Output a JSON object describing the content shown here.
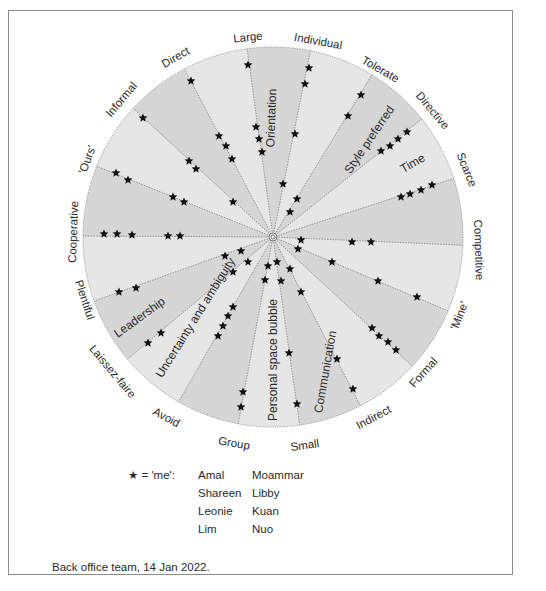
{
  "diagram": {
    "center": [
      273,
      237
    ],
    "radius": 190,
    "colors": {
      "sector_dark": "#d6d6d6",
      "sector_light": "#e6e6e6",
      "spoke": "#6e6e6e",
      "star": "#111111",
      "text": "#2a2a2a",
      "frame": "#8a8a8a"
    },
    "poles": [
      {
        "label": "Large",
        "end": [
          247,
          48
        ],
        "text_pos": [
          248,
          38
        ],
        "rotate": -6
      },
      {
        "label": "Individual",
        "end": [
          310,
          52
        ],
        "text_pos": [
          318,
          42
        ],
        "rotate": 10
      },
      {
        "label": "Tolerate",
        "end": [
          370,
          78
        ],
        "text_pos": [
          380,
          70
        ],
        "rotate": 30
      },
      {
        "label": "Directive",
        "end": [
          418,
          122
        ],
        "text_pos": [
          432,
          111
        ],
        "rotate": 50
      },
      {
        "label": "Scarce",
        "end": [
          449,
          180
        ],
        "text_pos": [
          466,
          170
        ],
        "rotate": 68
      },
      {
        "label": "Competitive",
        "end": [
          458,
          245
        ],
        "text_pos": [
          478,
          250
        ],
        "rotate": 88
      },
      {
        "label": "'Mine'",
        "end": [
          446,
          310
        ],
        "text_pos": [
          460,
          316
        ],
        "rotate": -68
      },
      {
        "label": "Formal",
        "end": [
          411,
          365
        ],
        "text_pos": [
          424,
          373
        ],
        "rotate": -48
      },
      {
        "label": "Indirect",
        "end": [
          360,
          405
        ],
        "text_pos": [
          374,
          418
        ],
        "rotate": -28
      },
      {
        "label": "Small",
        "end": [
          300,
          427
        ],
        "text_pos": [
          305,
          446
        ],
        "rotate": -8
      },
      {
        "label": "Group",
        "end": [
          238,
          425
        ],
        "text_pos": [
          234,
          444
        ],
        "rotate": 10
      },
      {
        "label": "Avoid",
        "end": [
          178,
          403
        ],
        "text_pos": [
          166,
          418
        ],
        "rotate": 28
      },
      {
        "label": "Laissez-faire",
        "end": [
          130,
          357
        ],
        "text_pos": [
          112,
          372
        ],
        "rotate": 50
      },
      {
        "label": "Plentiful",
        "end": [
          97,
          300
        ],
        "text_pos": [
          84,
          300
        ],
        "rotate": 72
      },
      {
        "label": "Cooperative",
        "end": [
          87,
          236
        ],
        "text_pos": [
          74,
          232
        ],
        "rotate": -88
      },
      {
        "label": "'Ours'",
        "end": [
          101,
          168
        ],
        "text_pos": [
          88,
          160
        ],
        "rotate": -70
      },
      {
        "label": "Informal",
        "end": [
          136,
          111
        ],
        "text_pos": [
          122,
          100
        ],
        "rotate": -50
      },
      {
        "label": "Direct",
        "end": [
          185,
          70
        ],
        "text_pos": [
          176,
          58
        ],
        "rotate": -30
      }
    ],
    "sectors": [
      {
        "label": "Orientation",
        "pos": [
          272,
          118
        ],
        "rotate": -88
      },
      {
        "label": "Style preferred",
        "pos": [
          370,
          140
        ],
        "rotate": -56
      },
      {
        "label": "Time",
        "pos": [
          413,
          164
        ],
        "rotate": -30
      },
      {
        "label": "Leadership",
        "pos": [
          140,
          318
        ],
        "rotate": -36
      },
      {
        "label": "Uncertainty and ambiguity",
        "pos": [
          196,
          318
        ],
        "rotate": -58
      },
      {
        "label": "Personal space bubble",
        "pos": [
          274,
          360
        ],
        "rotate": -90
      },
      {
        "label": "Communication",
        "pos": [
          326,
          372
        ],
        "rotate": -80
      }
    ],
    "stars": [
      {
        "spoke": "Large",
        "points": [
          [
            248,
            65
          ],
          [
            256,
            127
          ],
          [
            259,
            139
          ],
          [
            262,
            152
          ]
        ]
      },
      {
        "spoke": "Individual",
        "points": [
          [
            309,
            68
          ],
          [
            305,
            84
          ],
          [
            295,
            134
          ],
          [
            283,
            184
          ]
        ]
      },
      {
        "spoke": "Tolerate",
        "points": [
          [
            361,
            95
          ],
          [
            348,
            116
          ],
          [
            297,
            199
          ],
          [
            290,
            212
          ]
        ]
      },
      {
        "spoke": "Directive",
        "points": [
          [
            407,
            132
          ],
          [
            398,
            139
          ],
          [
            390,
            146
          ],
          [
            381,
            151
          ]
        ]
      },
      {
        "spoke": "Scarce",
        "points": [
          [
            432,
            185
          ],
          [
            421,
            190
          ],
          [
            410,
            194
          ],
          [
            401,
            197
          ]
        ]
      },
      {
        "spoke": "Competitive",
        "points": [
          [
            301,
            240
          ],
          [
            352,
            242
          ],
          [
            371,
            242
          ]
        ]
      },
      {
        "spoke": "'Mine'",
        "points": [
          [
            298,
            249
          ],
          [
            332,
            262
          ],
          [
            378,
            281
          ],
          [
            417,
            297
          ]
        ]
      },
      {
        "spoke": "Formal",
        "points": [
          [
            372,
            328
          ],
          [
            379,
            336
          ],
          [
            388,
            342
          ],
          [
            396,
            350
          ]
        ]
      },
      {
        "spoke": "Indirect",
        "points": [
          [
            290,
            269
          ],
          [
            301,
            292
          ],
          [
            337,
            359
          ],
          [
            353,
            389
          ]
        ]
      },
      {
        "spoke": "Small",
        "points": [
          [
            277,
            262
          ],
          [
            281,
            281
          ],
          [
            289,
            353
          ],
          [
            297,
            404
          ]
        ]
      },
      {
        "spoke": "Group",
        "points": [
          [
            268,
            266
          ],
          [
            265,
            280
          ],
          [
            243,
            392
          ],
          [
            241,
            407
          ]
        ]
      },
      {
        "spoke": "Avoid",
        "points": [
          [
            233,
            307
          ],
          [
            228,
            316
          ],
          [
            223,
            326
          ],
          [
            218,
            336
          ]
        ]
      },
      {
        "spoke": "Laissez-faire",
        "points": [
          [
            248,
            262
          ],
          [
            233,
            272
          ],
          [
            161,
            333
          ],
          [
            148,
            343
          ]
        ]
      },
      {
        "spoke": "Plentiful",
        "points": [
          [
            225,
            256
          ],
          [
            241,
            251
          ],
          [
            136,
            288
          ],
          [
            119,
            292
          ]
        ]
      },
      {
        "spoke": "Cooperative",
        "points": [
          [
            104,
            234
          ],
          [
            117,
            234
          ],
          [
            132,
            235
          ],
          [
            168,
            236
          ],
          [
            180,
            236
          ]
        ]
      },
      {
        "spoke": "'Ours'",
        "points": [
          [
            116,
            173
          ],
          [
            128,
            180
          ],
          [
            173,
            197
          ],
          [
            184,
            202
          ]
        ]
      },
      {
        "spoke": "Informal",
        "points": [
          [
            143,
            118
          ],
          [
            189,
            161
          ],
          [
            196,
            169
          ],
          [
            233,
            202
          ]
        ]
      },
      {
        "spoke": "Direct",
        "points": [
          [
            191,
            81
          ],
          [
            219,
            136
          ],
          [
            226,
            146
          ],
          [
            232,
            159
          ]
        ]
      }
    ]
  },
  "legend": {
    "star_symbol": "★",
    "key_text": " = 'me':",
    "names": [
      "Amal",
      "Moammar",
      "Shareen",
      "Libby",
      "Leonie",
      "Kuan",
      "Lim",
      "Nuo"
    ]
  },
  "caption": "Back office team, 14 Jan 2022."
}
